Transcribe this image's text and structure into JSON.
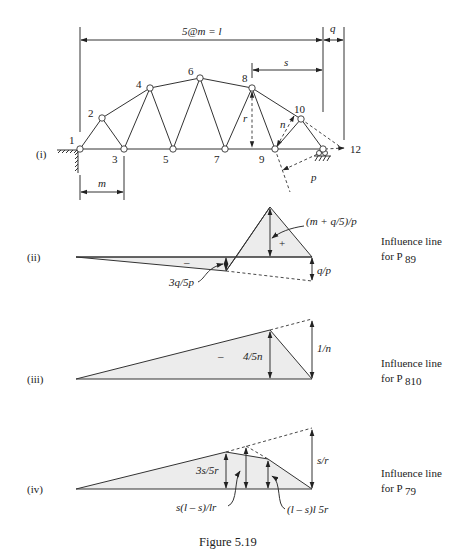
{
  "figure": {
    "caption": "Figure 5.19"
  },
  "truss": {
    "panel_label": "(i)",
    "span_label": "5@m = l",
    "q_label": "q",
    "s_label": "s",
    "m_label": "m",
    "r_label": "r",
    "n_label": "n",
    "p_label": "p",
    "nodes": [
      "1",
      "2",
      "3",
      "4",
      "5",
      "6",
      "7",
      "8",
      "9",
      "10",
      "12"
    ]
  },
  "panels": [
    {
      "label": "(ii)",
      "caption_line1": "Influence line",
      "caption_line2": "for P",
      "caption_sub": "89",
      "annotations": {
        "peak": "(m + q/5)/p",
        "negative": "3q/5p",
        "end": "q/p",
        "sign_plus": "+",
        "sign_minus": "–"
      }
    },
    {
      "label": "(iii)",
      "caption_line1": "Influence line",
      "caption_line2": "for P",
      "caption_sub": "810",
      "annotations": {
        "peak": "4/5n",
        "end": "1/n",
        "sign_minus": "–"
      }
    },
    {
      "label": "(iv)",
      "caption_line1": "Influence line",
      "caption_line2": "for P",
      "caption_sub": "79",
      "annotations": {
        "left_ordinate": "3s/5r",
        "mid_ordinate": "s(l – s)/lr",
        "right_ordinate": "(l – s)l 5r",
        "end": "s/r"
      }
    }
  ]
}
